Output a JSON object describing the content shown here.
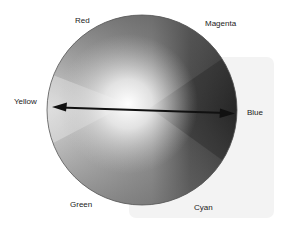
{
  "diagram": {
    "type": "color-wheel-grayscale",
    "labels": {
      "red": "Red",
      "magenta": "Magenta",
      "yellow": "Yellow",
      "blue": "Blue",
      "green": "Green",
      "cyan": "Cyan"
    },
    "arrow": {
      "from": "Yellow",
      "to": "Blue",
      "style": "double-headed"
    },
    "colors": {
      "panel": "#f3f3f3",
      "arrow": "#111111",
      "circle_outline": "#555555"
    }
  }
}
